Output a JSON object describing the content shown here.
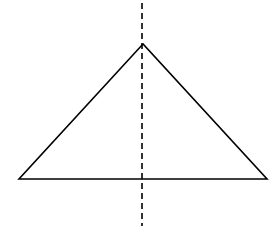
{
  "diagram": {
    "triangle": {
      "apex": [
        143,
        44
      ],
      "base_left": [
        19,
        179
      ],
      "base_right": [
        267,
        179
      ],
      "stroke": "#000000"
    },
    "symmetry_axis": {
      "x": 142,
      "y1": 3,
      "y2": 226,
      "style": "dashed",
      "stroke": "#000000"
    }
  }
}
